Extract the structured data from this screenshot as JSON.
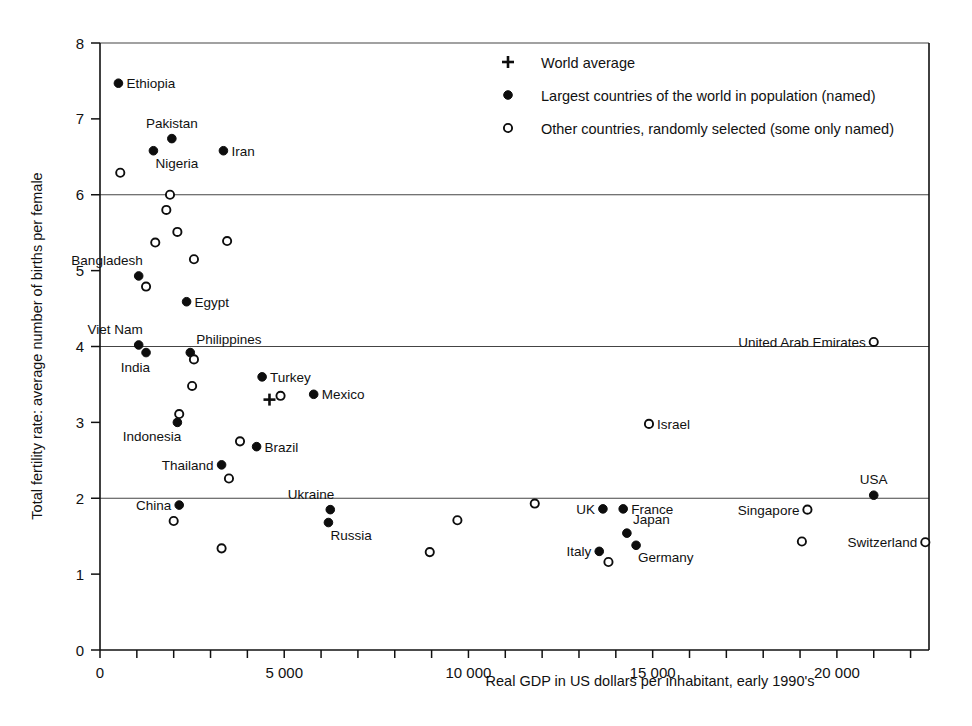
{
  "chart_data": {
    "type": "scatter",
    "title": "",
    "xlabel": "Real GDP in US dollars per inhabitant, early 1990's",
    "ylabel": "Total fertility rate: average number of births per female",
    "xlim": [
      0,
      22500
    ],
    "ylim": [
      0,
      8
    ],
    "grid": "horizontal gridlines at y = 2, 4, 6, 8",
    "legend_position": "top-right inside plot area",
    "x_tick_labels": [
      "0",
      "5 000",
      "10 000",
      "15 000",
      "20 000"
    ],
    "x_tick_values": [
      0,
      5000,
      10000,
      15000,
      20000
    ],
    "x_minor_tick_step": 1000,
    "y_tick_labels": [
      "0",
      "1",
      "2",
      "3",
      "4",
      "5",
      "6",
      "7",
      "8"
    ],
    "y_tick_values": [
      0,
      1,
      2,
      3,
      4,
      5,
      6,
      7,
      8
    ],
    "gridline_values": [
      2,
      4,
      6,
      8
    ],
    "legend": [
      {
        "marker": "cross",
        "label": "World average"
      },
      {
        "marker": "filled",
        "label": "Largest countries of the world in population (named)"
      },
      {
        "marker": "open",
        "label": "Other countries, randomly selected (some only named)"
      }
    ],
    "series": [
      {
        "name": "World average",
        "marker": "cross",
        "points": [
          {
            "label": "",
            "x": 4600,
            "y": 3.3,
            "label_pos": "none"
          }
        ]
      },
      {
        "name": "Largest countries of the world in population (named)",
        "marker": "filled",
        "points": [
          {
            "label": "Ethiopia",
            "x": 500,
            "y": 7.47,
            "label_pos": "right"
          },
          {
            "label": "Pakistan",
            "x": 1950,
            "y": 6.74,
            "label_pos": "above"
          },
          {
            "label": "Nigeria",
            "x": 1450,
            "y": 6.58,
            "label_pos": "below-right"
          },
          {
            "label": "Iran",
            "x": 3350,
            "y": 6.58,
            "label_pos": "right"
          },
          {
            "label": "Bangladesh",
            "x": 1050,
            "y": 4.93,
            "label_pos": "above-left"
          },
          {
            "label": "Egypt",
            "x": 2350,
            "y": 4.59,
            "label_pos": "right"
          },
          {
            "label": "Viet Nam",
            "x": 1050,
            "y": 4.02,
            "label_pos": "above-left"
          },
          {
            "label": "India",
            "x": 1250,
            "y": 3.92,
            "label_pos": "below-left"
          },
          {
            "label": "Philippines",
            "x": 2450,
            "y": 3.92,
            "label_pos": "above-right"
          },
          {
            "label": "Turkey",
            "x": 4400,
            "y": 3.6,
            "label_pos": "right"
          },
          {
            "label": "Mexico",
            "x": 5800,
            "y": 3.37,
            "label_pos": "right"
          },
          {
            "label": "Indonesia",
            "x": 2100,
            "y": 3.0,
            "label_pos": "below-left"
          },
          {
            "label": "Brazil",
            "x": 4250,
            "y": 2.68,
            "label_pos": "right"
          },
          {
            "label": "Thailand",
            "x": 3300,
            "y": 2.44,
            "label_pos": "left"
          },
          {
            "label": "China",
            "x": 2150,
            "y": 1.91,
            "label_pos": "left"
          },
          {
            "label": "Ukraine",
            "x": 6250,
            "y": 1.85,
            "label_pos": "above-left"
          },
          {
            "label": "Russia",
            "x": 6200,
            "y": 1.68,
            "label_pos": "below-right"
          },
          {
            "label": "UK",
            "x": 13650,
            "y": 1.86,
            "label_pos": "left"
          },
          {
            "label": "France",
            "x": 14200,
            "y": 1.86,
            "label_pos": "right"
          },
          {
            "label": "Japan",
            "x": 14300,
            "y": 1.54,
            "label_pos": "above-right"
          },
          {
            "label": "Germany",
            "x": 14550,
            "y": 1.38,
            "label_pos": "below-right"
          },
          {
            "label": "Italy",
            "x": 13550,
            "y": 1.3,
            "label_pos": "left"
          },
          {
            "label": "USA",
            "x": 21000,
            "y": 2.04,
            "label_pos": "above"
          }
        ]
      },
      {
        "name": "Other countries, randomly selected (some only named)",
        "marker": "open",
        "points": [
          {
            "label": "",
            "x": 550,
            "y": 6.29,
            "label_pos": "none"
          },
          {
            "label": "",
            "x": 1900,
            "y": 6.0,
            "label_pos": "none"
          },
          {
            "label": "",
            "x": 1800,
            "y": 5.8,
            "label_pos": "none"
          },
          {
            "label": "",
            "x": 2100,
            "y": 5.51,
            "label_pos": "none"
          },
          {
            "label": "",
            "x": 1500,
            "y": 5.37,
            "label_pos": "none"
          },
          {
            "label": "",
            "x": 3450,
            "y": 5.39,
            "label_pos": "none"
          },
          {
            "label": "",
            "x": 2550,
            "y": 5.15,
            "label_pos": "none"
          },
          {
            "label": "",
            "x": 1250,
            "y": 4.79,
            "label_pos": "none"
          },
          {
            "label": "",
            "x": 2550,
            "y": 3.83,
            "label_pos": "none"
          },
          {
            "label": "",
            "x": 2500,
            "y": 3.48,
            "label_pos": "none"
          },
          {
            "label": "",
            "x": 4900,
            "y": 3.35,
            "label_pos": "none"
          },
          {
            "label": "",
            "x": 2150,
            "y": 3.11,
            "label_pos": "none"
          },
          {
            "label": "Israel",
            "x": 14900,
            "y": 2.98,
            "label_pos": "right"
          },
          {
            "label": "",
            "x": 3800,
            "y": 2.75,
            "label_pos": "none"
          },
          {
            "label": "",
            "x": 3500,
            "y": 2.26,
            "label_pos": "none"
          },
          {
            "label": "",
            "x": 11800,
            "y": 1.93,
            "label_pos": "none"
          },
          {
            "label": "Singapore",
            "x": 19200,
            "y": 1.85,
            "label_pos": "left"
          },
          {
            "label": "",
            "x": 9700,
            "y": 1.71,
            "label_pos": "none"
          },
          {
            "label": "",
            "x": 2000,
            "y": 1.7,
            "label_pos": "none"
          },
          {
            "label": "",
            "x": 19050,
            "y": 1.43,
            "label_pos": "none"
          },
          {
            "label": "Switzerland",
            "x": 22400,
            "y": 1.42,
            "label_pos": "left"
          },
          {
            "label": "",
            "x": 3300,
            "y": 1.34,
            "label_pos": "none"
          },
          {
            "label": "",
            "x": 8950,
            "y": 1.29,
            "label_pos": "none"
          },
          {
            "label": "",
            "x": 13800,
            "y": 1.16,
            "label_pos": "none"
          },
          {
            "label": "United Arab Emirates",
            "x": 21000,
            "y": 4.06,
            "label_pos": "left"
          }
        ]
      }
    ]
  }
}
